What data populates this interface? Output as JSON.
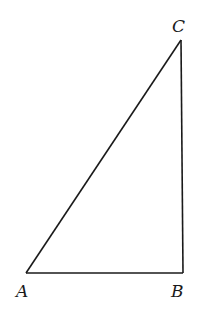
{
  "diagram": {
    "type": "right-triangle",
    "stroke_color": "#1a1a1a",
    "background": "#ffffff",
    "vertices": {
      "A": {
        "label": "A",
        "x": 26,
        "y": 273
      },
      "B": {
        "label": "B",
        "x": 183,
        "y": 273
      },
      "C": {
        "label": "C",
        "x": 181,
        "y": 40
      }
    },
    "labels": {
      "A": "A",
      "B": "B",
      "C": "C"
    },
    "right_angle_at": "B"
  }
}
